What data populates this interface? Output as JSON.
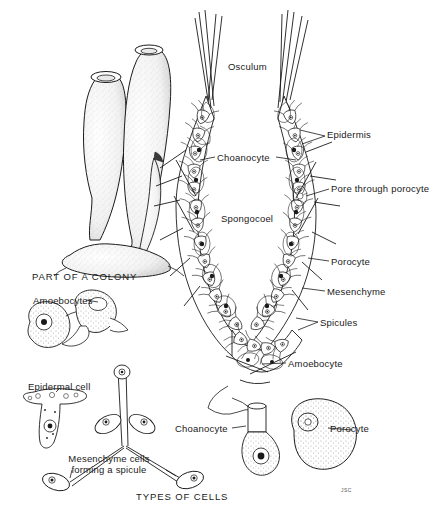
{
  "figure": {
    "background_color": "#ffffff",
    "ink_color": "#1a1a1a",
    "width": 443,
    "height": 513
  },
  "captions": [
    {
      "id": "part-of-a-colony",
      "text": "PART OF A COLONY",
      "x": 32,
      "y": 272,
      "style": "caps"
    },
    {
      "id": "types-of-cells",
      "text": "TYPES OF CELLS",
      "x": 136,
      "y": 492,
      "style": "caps"
    }
  ],
  "labels": [
    {
      "id": "osculum",
      "text": "Osculum",
      "x": 228,
      "y": 61
    },
    {
      "id": "epidermis",
      "text": "Epidermis",
      "x": 327,
      "y": 134
    },
    {
      "id": "choanocyte-wall",
      "text": "Choanocyte",
      "x": 217,
      "y": 152
    },
    {
      "id": "pore-through-porocyte",
      "text": "Pore through porocyte",
      "x": 331,
      "y": 185
    },
    {
      "id": "spongocoel",
      "text": "Spongocoel",
      "x": 221,
      "y": 214
    },
    {
      "id": "porocyte-wall",
      "text": "Porocyte",
      "x": 331,
      "y": 257
    },
    {
      "id": "mesenchyme",
      "text": "Mesenchyme",
      "x": 327,
      "y": 287
    },
    {
      "id": "spicules",
      "text": "Spicules",
      "x": 320,
      "y": 318
    },
    {
      "id": "amoebocyte-wall",
      "text": "Amoebocyte",
      "x": 288,
      "y": 359
    },
    {
      "id": "amoebocytes",
      "text": "Amoebocytes",
      "x": 33,
      "y": 296
    },
    {
      "id": "epidermal-cell",
      "text": "Epidermal cell",
      "x": 28,
      "y": 382
    },
    {
      "id": "choanocyte-cell",
      "text": "Choanocyte",
      "x": 175,
      "y": 424
    },
    {
      "id": "porocyte-cell",
      "text": "Porocyte",
      "x": 330,
      "y": 424
    }
  ],
  "multiline_labels": [
    {
      "id": "mesenchyme-cells-spicule",
      "line1": "Mesenchyme cells",
      "line2": "forming a spicule",
      "x": 54,
      "y": 456
    }
  ],
  "signature": {
    "id": "artist-signature",
    "text": "JSC",
    "x": 341,
    "y": 488
  },
  "structures": {
    "colony": {
      "name": "part-of-a-colony-drawing",
      "description": "Two upright vase-shaped sponge individuals with oscula at the tips, joined at a common stolon base"
    },
    "body_wall_section": {
      "name": "body-wall-cross-section",
      "description": "U-shaped cut-away of the sponge wall showing choanocytes lining the spongocoel, epidermis outside, mesenchyme between, spicules projecting, porocytes with pores"
    },
    "cell_types": [
      {
        "name": "amoebocyte-cell-drawing"
      },
      {
        "name": "epidermal-cell-drawing"
      },
      {
        "name": "mesenchyme-spicule-drawing"
      },
      {
        "name": "choanocyte-cell-drawing"
      },
      {
        "name": "porocyte-cell-drawing"
      }
    ]
  }
}
